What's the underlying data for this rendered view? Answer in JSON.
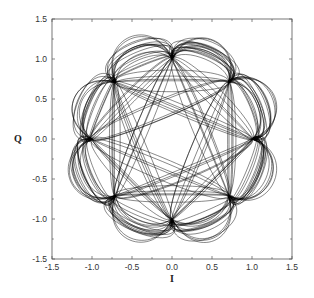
{
  "chart_data": {
    "type": "scatter",
    "subtype": "constellation-trajectory",
    "title": "",
    "xlabel": "I",
    "ylabel": "Q",
    "xlim": [
      -1.5,
      1.5
    ],
    "ylim": [
      -1.5,
      1.5
    ],
    "xticks": [
      "-1.5",
      "-1.0",
      "-0.5",
      "0.0",
      "0.5",
      "1.0",
      "1.5"
    ],
    "yticks": [
      "1.5",
      "1.0",
      "0.5",
      "0.0",
      "-0.5",
      "-1.0",
      "-1.5"
    ],
    "grid": false,
    "legend": null,
    "constellation_points": [
      {
        "I": 1.0,
        "Q": 0.0
      },
      {
        "I": 0.707,
        "Q": 0.707
      },
      {
        "I": 0.0,
        "Q": 1.0
      },
      {
        "I": -0.707,
        "Q": 0.707
      },
      {
        "I": -1.0,
        "Q": 0.0
      },
      {
        "I": -0.707,
        "Q": -0.707
      },
      {
        "I": 0.0,
        "Q": -1.0
      },
      {
        "I": 0.707,
        "Q": -0.707
      }
    ],
    "line_color": "#000000"
  }
}
